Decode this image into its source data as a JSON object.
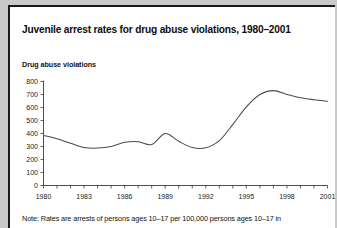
{
  "figure": {
    "title": "Juvenile arrest rates for drug abuse violations, 1980–2001",
    "subtitle": "Drug abuse violations",
    "note": "Note: Rates are arrests of persons ages 10–17 per 100,000 persons ages 10–17 in"
  },
  "chart_data": {
    "type": "line",
    "title": "Juvenile arrest rates for drug abuse violations, 1980–2001",
    "subtitle": "Drug abuse violations",
    "xlabel": "",
    "ylabel": "Drug abuse violations",
    "ylim": [
      0,
      800
    ],
    "xlim": [
      1980,
      2001
    ],
    "ytick_labels": [
      "0",
      "100",
      "200",
      "300",
      "400",
      "500",
      "600",
      "700",
      "800"
    ],
    "ytick_values": [
      0,
      100,
      200,
      300,
      400,
      500,
      600,
      700,
      800
    ],
    "xtick_labels": [
      "1980",
      "1983",
      "1986",
      "1989",
      "1992",
      "1995",
      "1998",
      "2001"
    ],
    "xtick_values": [
      1980,
      1983,
      1986,
      1989,
      1992,
      1995,
      1998,
      2001
    ],
    "xtick_minor_values": [
      1981,
      1982,
      1984,
      1985,
      1987,
      1988,
      1990,
      1991,
      1993,
      1994,
      1996,
      1997,
      1999,
      2000
    ],
    "grid": false,
    "legend": false,
    "line_color": "#4a4a4a",
    "x": [
      1980,
      1981,
      1982,
      1983,
      1984,
      1985,
      1986,
      1987,
      1988,
      1989,
      1990,
      1991,
      1992,
      1993,
      1994,
      1995,
      1996,
      1997,
      1998,
      1999,
      2000,
      2001
    ],
    "values": [
      385,
      360,
      325,
      292,
      288,
      300,
      332,
      337,
      315,
      400,
      340,
      292,
      290,
      345,
      470,
      605,
      700,
      730,
      700,
      675,
      660,
      648
    ]
  }
}
